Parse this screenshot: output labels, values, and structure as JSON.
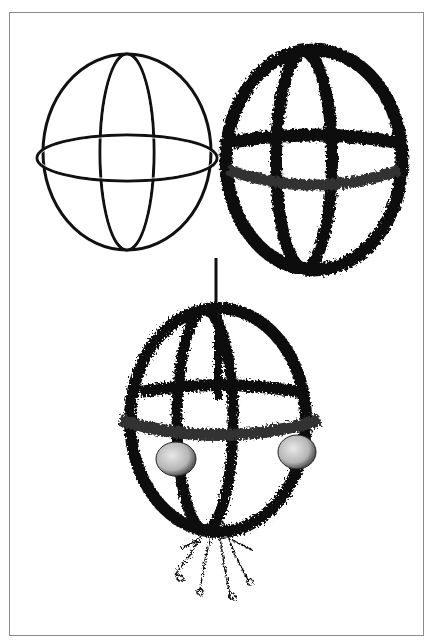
{
  "illustration": {
    "subject": "kissing ball construction stages",
    "panels": [
      {
        "name": "bare-wire-frame",
        "description": "Sphere frame of three wire hoops"
      },
      {
        "name": "moss-covered-frame",
        "description": "Frame wrapped with greenery"
      },
      {
        "name": "finished-kissing-ball",
        "description": "Hanging greenery ball with apples and mistletoe"
      }
    ],
    "colors": {
      "ink": "#111111",
      "paper": "#ffffff",
      "border": "#8a8a8a",
      "apple": "#cfcfcf"
    }
  }
}
